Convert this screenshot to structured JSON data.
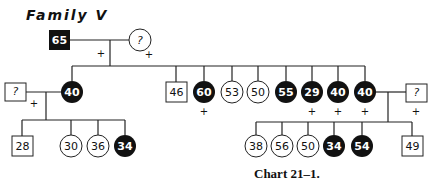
{
  "title": "Family V",
  "caption": "Chart 21–1.",
  "colors": {
    "affected": "#111111",
    "unaffected": "#ffffff",
    "line": "#222222"
  },
  "legend_note": "Filled symbols = affected; squares = male; circles = female; '+' marks; numbers are ages; '?' = unknown",
  "generation1": [
    {
      "id": "g1-father",
      "sex": "male",
      "affected": true,
      "label": "65",
      "plus": true
    },
    {
      "id": "g1-mother",
      "sex": "female",
      "affected": false,
      "label": "?",
      "plus": true
    }
  ],
  "generation2": [
    {
      "id": "g2-1",
      "sex": "female",
      "affected": true,
      "label": "40",
      "plus": false,
      "spouse": {
        "sex": "male",
        "label": "?",
        "plus": true
      }
    },
    {
      "id": "g2-2",
      "sex": "male",
      "affected": false,
      "label": "46",
      "plus": false
    },
    {
      "id": "g2-3",
      "sex": "female",
      "affected": true,
      "label": "60",
      "plus": true
    },
    {
      "id": "g2-4",
      "sex": "female",
      "affected": false,
      "label": "53",
      "plus": false
    },
    {
      "id": "g2-5",
      "sex": "female",
      "affected": false,
      "label": "50",
      "plus": false
    },
    {
      "id": "g2-6",
      "sex": "female",
      "affected": true,
      "label": "55",
      "plus": false
    },
    {
      "id": "g2-7",
      "sex": "female",
      "affected": true,
      "label": "29",
      "plus": true
    },
    {
      "id": "g2-8",
      "sex": "female",
      "affected": true,
      "label": "40",
      "plus": true
    },
    {
      "id": "g2-9",
      "sex": "female",
      "affected": true,
      "label": "40",
      "plus": true,
      "spouse": {
        "sex": "male",
        "label": "?",
        "plus": true
      }
    }
  ],
  "generation3_left": [
    {
      "sex": "male",
      "affected": false,
      "label": "28"
    },
    {
      "sex": "female",
      "affected": false,
      "label": "30"
    },
    {
      "sex": "female",
      "affected": false,
      "label": "36"
    },
    {
      "sex": "female",
      "affected": true,
      "label": "34"
    }
  ],
  "generation3_right": [
    {
      "sex": "female",
      "affected": false,
      "label": "38"
    },
    {
      "sex": "female",
      "affected": false,
      "label": "56"
    },
    {
      "sex": "female",
      "affected": false,
      "label": "50"
    },
    {
      "sex": "female",
      "affected": true,
      "label": "34"
    },
    {
      "sex": "female",
      "affected": true,
      "label": "54"
    },
    {
      "sex": "male",
      "affected": false,
      "label": "49"
    }
  ],
  "plus_symbol": "+"
}
